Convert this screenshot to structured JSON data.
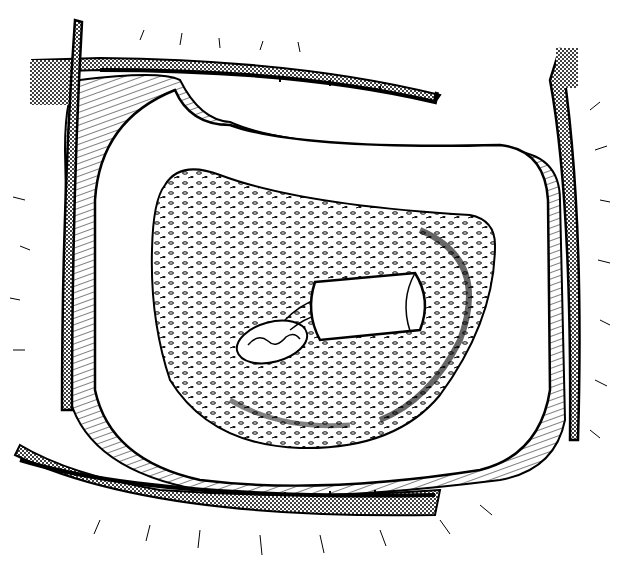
{
  "image": {
    "description": "Black-and-white surgical line illustration: eyelids held open by four retractor blades, exposing a textured orbital socket containing a white cylindrical implant with an attached muscle/tissue loop",
    "colors": {
      "ink": "#000000",
      "paper": "#ffffff",
      "stipple": "#555555"
    },
    "elements": [
      "upper-retractor",
      "lower-retractor",
      "left-retractor",
      "right-retractor",
      "eyelid-tissue",
      "orbital-socket",
      "cylindrical-implant",
      "tissue-loop"
    ]
  }
}
